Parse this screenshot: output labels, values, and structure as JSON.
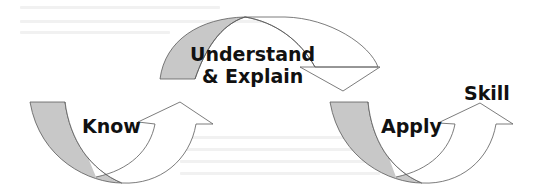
{
  "diagram": {
    "type": "cycle-arrows",
    "colors": {
      "band_fill": "#c8c8c8",
      "arrow_fill": "#ffffff",
      "stroke": "#5a5a5a",
      "text": "#111111"
    },
    "stages": [
      {
        "id": "know",
        "label": "Know"
      },
      {
        "id": "understand",
        "label_line1": "Understand",
        "label_line2": "& Explain"
      },
      {
        "id": "apply",
        "label": "Apply"
      }
    ],
    "outcome": {
      "label": "Skill"
    }
  }
}
